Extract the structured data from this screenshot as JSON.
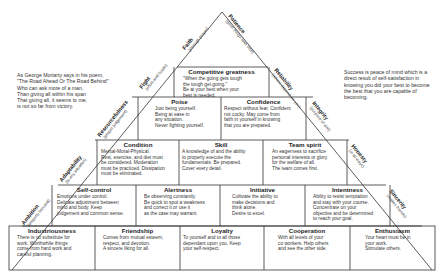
{
  "quotes": {
    "left": "As George Moriarty says in his poem,\n\"The Road Ahead Or The Road Behind\"\nWho can ask more of a man,\nThan giving all within his span\nThat giving all, it seems to me,\nis not so far from victory.",
    "right": "Success is peace of mind which is a\ndirect result of self-satisfaction in\nknowing you did your best to become\nthe best that you are capable of\nbecoming."
  },
  "blocks": {
    "competitive_greatness": {
      "title": "Competitive greatness",
      "desc": "\"When the going gets tough\nthe tough get going.\"\nBe at your best when your\nbest is needed.\nReal love of a hard battle."
    },
    "poise": {
      "title": "Poise",
      "desc": "Just being yourself.\nBeing at ease in\nany situation.\nNever fighting yourself."
    },
    "confidence": {
      "title": "Confidence",
      "desc": "Respect without fear. Confident\nnot cocky. May come from\nfaith in yourself in knowing\nthat you are prepared."
    },
    "condition": {
      "title": "Condition",
      "desc": "Mental-Moral-Physical.\nRest, exercise, and diet must\nbe considered. Moderation\nmust be practiced. Dissipation\nmust be eliminated."
    },
    "skill": {
      "title": "Skill",
      "desc": "A knowledge of and the ability\nto properly execute the\nfundamentals. Be prepared.\nCover every detail."
    },
    "team_spirit": {
      "title": "Team spirit",
      "desc": "An eagerness to sacrifice\npersonal interests or glory\nfor the welfare of all.\nThe team comes first."
    },
    "self_control": {
      "title": "Self-control",
      "desc": "Emotions under control.\nDelicate adjustment between\nmind and body. Keep\njudgement and common sense."
    },
    "alertness": {
      "title": "Alertness",
      "desc": "Be observing constantly.\nBe quick to spot a weakness\nand correct it or use it\nas the case may warrant."
    },
    "initiative": {
      "title": "Initiative",
      "desc": "Cultivate the ability to\nmake decisions and\nthink alone.\nDesire to excel."
    },
    "intentness": {
      "title": "Intentness",
      "desc": "Ability to resist temptation\nand stay with your course.\nConcentrate on your\nobjective and be determined\nto reach your goal."
    },
    "industriousness": {
      "title": "Industriousness",
      "desc": "There is no substitute for\nwork. Worthwhile things\ncome from hard work and\ncareful planning."
    },
    "friendship": {
      "title": "Friendship",
      "desc": "Comes from mutual esteem,\nrespect, and devotion.\nA sincere liking for all."
    },
    "loyalty": {
      "title": "Loyalty",
      "desc": "To yourself and to all those\ndependant upon you. Keep\nyour self-respect."
    },
    "cooperation": {
      "title": "Cooperation",
      "desc": "With all levels of your\nco workers. Help others\nand see the other side."
    },
    "enthusiasm": {
      "title": "Enthusiasm",
      "desc": "Your heart must be in\nyour work.\nStimulate others."
    }
  },
  "sides": {
    "faith": {
      "name": "Faith",
      "sub": "(through prayer)"
    },
    "patience": {
      "name": "Patience",
      "sub": "(good things take time)"
    },
    "fight": {
      "name": "Fight",
      "sub": "(effort and hustle)"
    },
    "reliability": {
      "name": "Reliability",
      "sub": "(others depend on you)"
    },
    "resourcefulness": {
      "name": "Resourcefulness",
      "sub": "(proper judgement)"
    },
    "integrity": {
      "name": "Integrity",
      "sub": "(purpose of aim)"
    },
    "adaptability": {
      "name": "Adaptability",
      "sub": "(to any situation)"
    },
    "honesty": {
      "name": "Honesty",
      "sub": "(in all ways)"
    },
    "ambition": {
      "name": "Ambition",
      "sub": "(properly focused)"
    },
    "sincerity": {
      "name": "Sincerity",
      "sub": "(makes friends)"
    }
  }
}
